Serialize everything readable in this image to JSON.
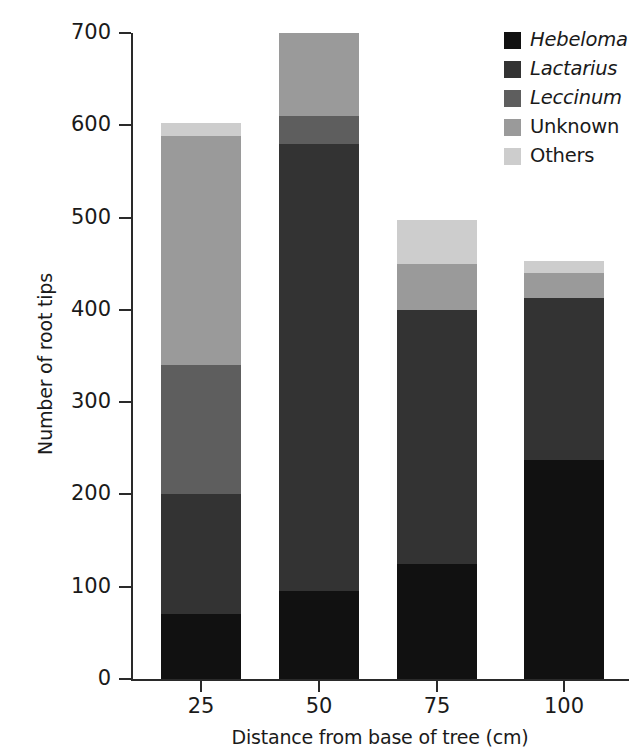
{
  "chart_data": {
    "type": "bar",
    "subtype": "stacked-bar",
    "title": "",
    "xlabel": "Distance from base of tree (cm)",
    "ylabel": "Number of root tips",
    "categories": [
      "25",
      "50",
      "75",
      "100"
    ],
    "xlim": [
      0,
      4
    ],
    "ylim": [
      0,
      700
    ],
    "ytick_labels": [
      "0",
      "100",
      "200",
      "300",
      "400",
      "500",
      "600",
      "700"
    ],
    "ytick_values": [
      0,
      100,
      200,
      300,
      400,
      500,
      600,
      700
    ],
    "grid": false,
    "legend_position": "top-right",
    "series": [
      {
        "name": "Hebeloma",
        "italic": true,
        "color": "#111111",
        "values": [
          70,
          95,
          125,
          237
        ]
      },
      {
        "name": "Lactarius",
        "italic": true,
        "color": "#333333",
        "values": [
          130,
          485,
          275,
          176
        ]
      },
      {
        "name": "Leccinum",
        "italic": true,
        "color": "#5e5e5e",
        "values": [
          140,
          30,
          0,
          0
        ]
      },
      {
        "name": "Unknown",
        "italic": false,
        "color": "#9a9a9a",
        "values": [
          248,
          90,
          50,
          27
        ]
      },
      {
        "name": "Others",
        "italic": false,
        "color": "#cdcdcd",
        "values": [
          15,
          0,
          47,
          13
        ]
      }
    ],
    "totals": [
      603,
      700,
      497,
      453
    ]
  },
  "legend": {
    "items": [
      {
        "label": "Hebeloma"
      },
      {
        "label": "Lactarius"
      },
      {
        "label": "Leccinum"
      },
      {
        "label": "Unknown"
      },
      {
        "label": "Others"
      }
    ]
  },
  "axes": {
    "y_title": "Number of root tips",
    "x_title": "Distance from base of tree (cm)"
  }
}
